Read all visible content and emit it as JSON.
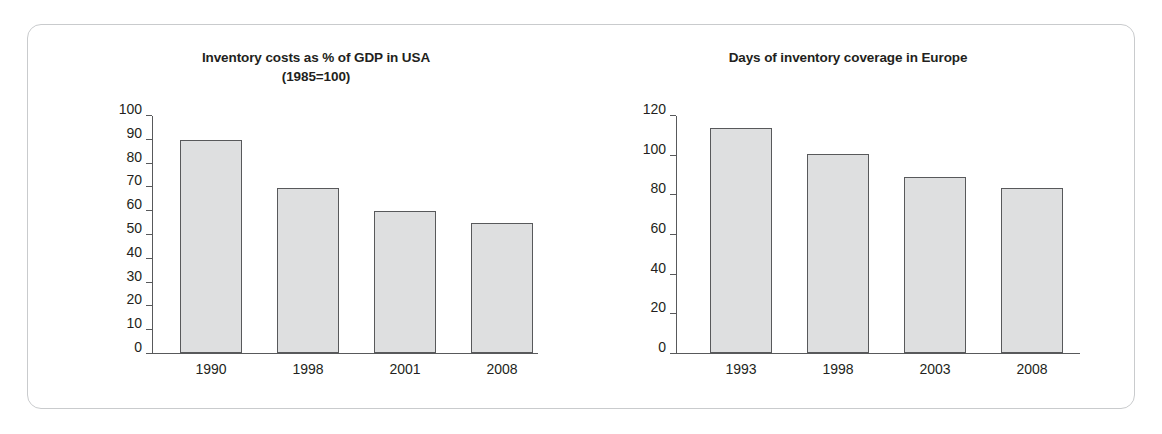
{
  "figure": {
    "frame_color": "#c9cbcd",
    "bar_fill": "#dedfe0",
    "bar_border": "#58595b",
    "axis_color": "#58595b",
    "text_color": "#231f20"
  },
  "chart_data": [
    {
      "type": "bar",
      "id": "usa",
      "title": "Inventory costs as % of GDP in USA",
      "subtitle": "(1985=100)",
      "xlabel": "",
      "ylabel": "",
      "categories": [
        "1990",
        "1998",
        "2001",
        "2008"
      ],
      "values": [
        90,
        69.5,
        60,
        55
      ],
      "ylim": [
        0,
        100
      ],
      "yticks": [
        0,
        10,
        20,
        30,
        40,
        50,
        60,
        70,
        80,
        90,
        100
      ],
      "ytick_labels": [
        "0",
        "10",
        "20",
        "30",
        "40",
        "50",
        "60",
        "70",
        "80",
        "90",
        "100"
      ],
      "grid": false,
      "legend": false
    },
    {
      "type": "bar",
      "id": "europe",
      "title": "Days of inventory coverage in Europe",
      "subtitle": "",
      "xlabel": "",
      "ylabel": "",
      "categories": [
        "1993",
        "1998",
        "2003",
        "2008"
      ],
      "values": [
        114,
        101,
        89,
        83.5
      ],
      "ylim": [
        0,
        120
      ],
      "yticks": [
        0,
        20,
        40,
        60,
        80,
        100,
        120
      ],
      "ytick_labels": [
        "0",
        "20",
        "40",
        "60",
        "80",
        "100",
        "120"
      ],
      "grid": false,
      "legend": false
    }
  ]
}
